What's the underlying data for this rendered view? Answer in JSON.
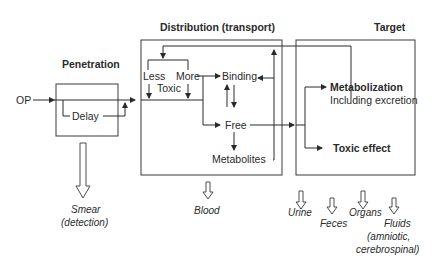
{
  "headers": {
    "penetration": "Penetration",
    "distribution": "Distribution (transport)",
    "target": "Target"
  },
  "penetration": {
    "input": "OP",
    "delay": "Delay",
    "output": {
      "line1": "Smear",
      "line2": "(detection)"
    }
  },
  "distribution": {
    "less": "Less",
    "more": "More",
    "toxic": "Toxic",
    "binding": "Binding",
    "free": "Free",
    "metabolites": "Metabolites",
    "output": "Blood"
  },
  "target": {
    "metabolization": "Metabolization",
    "including": "Including excretion",
    "toxic_effect": "Toxic effect",
    "outputs": [
      {
        "label": "Urine"
      },
      {
        "label": "Feces"
      },
      {
        "label": "Organs"
      },
      {
        "label": "Fluids",
        "line2": "(amniotic,",
        "line3": "cerebrospinal)"
      }
    ]
  },
  "colors": {
    "line": "#2a2a2a",
    "background": "#ffffff"
  }
}
